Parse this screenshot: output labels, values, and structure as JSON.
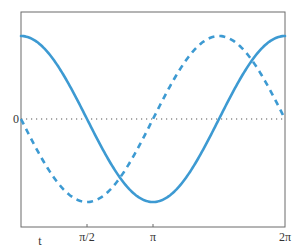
{
  "chart_data": {
    "type": "line",
    "title": "",
    "xlabel": "t",
    "ylabel": "",
    "xlim": [
      0,
      6.283185307
    ],
    "ylim": [
      -1.29,
      1.29
    ],
    "grid": false,
    "legend": null,
    "x_ticks": [
      {
        "value": 1.5707963,
        "label": "π/2"
      },
      {
        "value": 3.1415927,
        "label": "π"
      },
      {
        "value": 6.2831853,
        "label": "2π"
      }
    ],
    "y_ticks": [
      {
        "value": 0,
        "label": "0"
      }
    ],
    "reference_lines": [
      {
        "axis": "y",
        "value": 0,
        "style": "dotted"
      }
    ],
    "series": [
      {
        "name": "cos t",
        "style": "solid",
        "color": "#3d9ad2",
        "x": [
          0,
          0.785,
          1.571,
          2.356,
          3.142,
          3.927,
          4.712,
          5.498,
          6.283
        ],
        "values": [
          1,
          0.707,
          0,
          -0.707,
          -1,
          -0.707,
          0,
          0.707,
          1
        ]
      },
      {
        "name": "-sin t",
        "style": "dashed",
        "color": "#3d9ad2",
        "x": [
          0,
          0.785,
          1.571,
          2.356,
          3.142,
          3.927,
          4.712,
          5.498,
          6.283
        ],
        "values": [
          0,
          -0.707,
          -1,
          -0.707,
          0,
          0.707,
          1,
          0.707,
          0
        ]
      }
    ]
  },
  "labels": {
    "x_axis_label": "t",
    "zero_label": "0",
    "tick_pi_half": "π/2",
    "tick_pi": "π",
    "tick_two_pi": "2π"
  },
  "colors": {
    "curve": "#3d9ad2",
    "frame": "#666666",
    "zero_line": "#555555"
  }
}
